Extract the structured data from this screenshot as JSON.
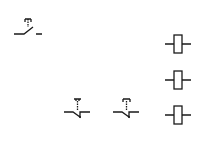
{
  "diagram": {
    "type": "electrical-schematic-symbols",
    "stroke_color": "#1a1a1a",
    "background": "#ffffff",
    "symbols": [
      {
        "id": "pb-no",
        "kind": "pushbutton-normally-open",
        "icon": "pushbutton-no-icon"
      },
      {
        "id": "pb-nc-1",
        "kind": "pushbutton-normally-closed",
        "icon": "pushbutton-nc-icon"
      },
      {
        "id": "pb-nc-2",
        "kind": "pushbutton-normally-closed",
        "icon": "pushbutton-nc-icon"
      },
      {
        "id": "coil-1",
        "kind": "relay-coil",
        "icon": "coil-icon"
      },
      {
        "id": "coil-2",
        "kind": "relay-coil",
        "icon": "coil-icon"
      },
      {
        "id": "coil-3",
        "kind": "relay-coil",
        "icon": "coil-icon"
      }
    ]
  }
}
